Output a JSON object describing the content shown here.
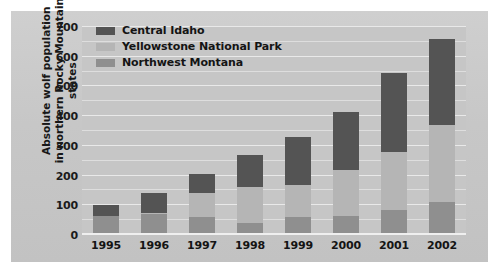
{
  "chart_data": {
    "type": "bar",
    "subtype": "stacked-bar",
    "title": "",
    "xlabel": "",
    "ylabel": "Absolute wolf population in northern Rocky Mountain states",
    "ylabel_line1": "Absolute wolf population",
    "ylabel_line2": "in northern Rocky Mountain states",
    "categories": [
      "1995",
      "1996",
      "1997",
      "1998",
      "1999",
      "2000",
      "2001",
      "2002"
    ],
    "series": [
      {
        "name": "Northwest Montana",
        "color": "#8f8f8f",
        "values": [
          65,
          70,
          60,
          40,
          60,
          65,
          85,
          110
        ]
      },
      {
        "name": "Yellowstone National Park",
        "color": "#b5b5b5",
        "values": [
          0,
          5,
          80,
          120,
          110,
          155,
          195,
          260
        ]
      },
      {
        "name": "Central Idaho",
        "color": "#545454",
        "values": [
          35,
          65,
          65,
          110,
          160,
          195,
          265,
          290
        ]
      }
    ],
    "totals": [
      100,
      140,
      205,
      270,
      330,
      415,
      545,
      660
    ],
    "ylim": [
      0,
      700
    ],
    "yticks": [
      0,
      100,
      200,
      300,
      400,
      500,
      600,
      700
    ],
    "ytick_labels": [
      "0",
      "100",
      "200",
      "300",
      "400",
      "500",
      "600",
      "700"
    ],
    "minor_ticks": [
      50,
      150,
      250,
      350,
      450,
      550,
      650
    ],
    "grid": true,
    "legend_position": "top-left",
    "legend_order": [
      "Central Idaho",
      "Yellowstone National Park",
      "Northwest Montana"
    ],
    "background_color": "#c6c6c6",
    "gridline_color": "#e9e9e9",
    "text_color": "#141414"
  },
  "legend": {
    "items": [
      {
        "label": "Central Idaho",
        "color": "#545454"
      },
      {
        "label": "Yellowstone National Park",
        "color": "#b5b5b5"
      },
      {
        "label": "Northwest Montana",
        "color": "#8f8f8f"
      }
    ]
  }
}
